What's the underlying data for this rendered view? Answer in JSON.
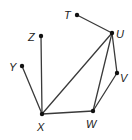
{
  "diagram": {
    "type": "graph",
    "nodes": [
      {
        "id": "T",
        "label": "T",
        "x": 77,
        "y": 15,
        "lx": 64,
        "ly": 19
      },
      {
        "id": "U",
        "label": "U",
        "x": 112,
        "y": 33,
        "lx": 116,
        "ly": 38
      },
      {
        "id": "Z",
        "label": "Z",
        "x": 41,
        "y": 36,
        "lx": 28,
        "ly": 41
      },
      {
        "id": "Y",
        "label": "Y",
        "x": 22,
        "y": 66,
        "lx": 9,
        "ly": 71
      },
      {
        "id": "V",
        "label": "V",
        "x": 117,
        "y": 73,
        "lx": 120,
        "ly": 82
      },
      {
        "id": "X",
        "label": "X",
        "x": 42,
        "y": 114,
        "lx": 37,
        "ly": 131
      },
      {
        "id": "W",
        "label": "W",
        "x": 93,
        "y": 111,
        "lx": 86,
        "ly": 128
      }
    ],
    "edges": [
      [
        "T",
        "U"
      ],
      [
        "U",
        "X"
      ],
      [
        "U",
        "W"
      ],
      [
        "U",
        "V"
      ],
      [
        "V",
        "W"
      ],
      [
        "W",
        "X"
      ],
      [
        "X",
        "Z"
      ],
      [
        "X",
        "Y"
      ]
    ],
    "colors": {
      "edge": "#3a3a3a",
      "node": "#111111",
      "label": "#222222"
    }
  }
}
